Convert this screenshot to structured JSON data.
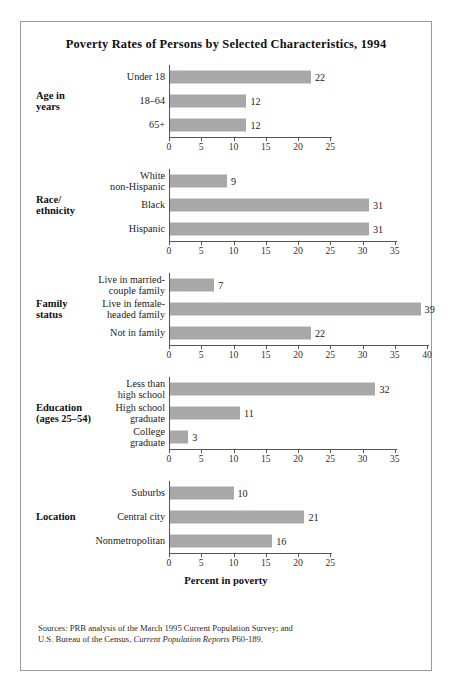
{
  "figure": {
    "title": "Poverty Rates of Persons by Selected Characteristics, 1994",
    "axis_title": "Percent in poverty",
    "bar_color": "#a8a8a8",
    "source_line1": "Sources: PRB analysis of the March 1995 Current Population Survey; and",
    "source_line2_pre": "U.S. Bureau of the Census, ",
    "source_line2_italic": "Current Population Reports",
    "source_line2_post": " P60-189."
  },
  "chart_data": {
    "type": "bar",
    "title": "Poverty Rates of Persons by Selected Characteristics, 1994",
    "xlabel": "Percent in poverty",
    "ylabel": "",
    "orientation": "horizontal",
    "grid": false,
    "legend": "none",
    "value_labels": true,
    "panels": [
      {
        "group": "Age in\nyears",
        "xlim": [
          0,
          25
        ],
        "xticks": [
          0,
          5,
          10,
          15,
          20,
          25
        ],
        "categories": [
          "Under 18",
          "18–64",
          "65+"
        ],
        "values": [
          22,
          12,
          12
        ]
      },
      {
        "group": "Race/\nethnicity",
        "xlim": [
          0,
          35
        ],
        "xticks": [
          0,
          5,
          10,
          15,
          20,
          25,
          30,
          35
        ],
        "categories": [
          "White\nnon-Hispanic",
          "Black",
          "Hispanic"
        ],
        "values": [
          9,
          31,
          31
        ]
      },
      {
        "group": "Family\nstatus",
        "xlim": [
          0,
          40
        ],
        "xticks": [
          0,
          5,
          10,
          15,
          20,
          25,
          30,
          35,
          40
        ],
        "categories": [
          "Live in married-\ncouple family",
          "Live in female-\nheaded family",
          "Not in family"
        ],
        "values": [
          7,
          39,
          22
        ]
      },
      {
        "group": "Education\n(ages 25–54)",
        "xlim": [
          0,
          35
        ],
        "xticks": [
          0,
          5,
          10,
          15,
          20,
          25,
          30,
          35
        ],
        "categories": [
          "Less than\nhigh school",
          "High school\ngraduate",
          "College\ngraduate"
        ],
        "values": [
          32,
          11,
          3
        ]
      },
      {
        "group": "Location",
        "xlim": [
          0,
          25
        ],
        "xticks": [
          0,
          5,
          10,
          15,
          20,
          25
        ],
        "categories": [
          "Suburbs",
          "Central city",
          "Nonmetropolitan"
        ],
        "values": [
          10,
          21,
          16
        ]
      }
    ]
  }
}
